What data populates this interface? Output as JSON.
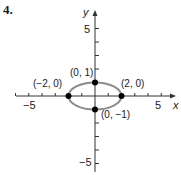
{
  "problem_number": "4.",
  "chart_data": {
    "type": "line",
    "title": "",
    "xlabel": "x",
    "ylabel": "y",
    "xlim": [
      -6,
      6
    ],
    "ylim": [
      -6,
      6
    ],
    "xticks": [
      -5,
      5
    ],
    "yticks": [
      5,
      -5
    ],
    "grid": false,
    "series": [
      {
        "name": "ellipse",
        "shape": "ellipse",
        "center": [
          0,
          0
        ],
        "semi_major_x": 2,
        "semi_minor_y": 1,
        "color": "#8c8c8c"
      }
    ],
    "points": [
      {
        "x": -2,
        "y": 0,
        "label": "(−2, 0)"
      },
      {
        "x": 2,
        "y": 0,
        "label": "(2, 0)"
      },
      {
        "x": 0,
        "y": 1,
        "label": "(0, 1)"
      },
      {
        "x": 0,
        "y": -1,
        "label": "(0, −1)"
      }
    ],
    "tick_labels": {
      "x_neg": "−5",
      "x_pos": "5",
      "y_pos": "5",
      "y_neg": "−5"
    }
  }
}
